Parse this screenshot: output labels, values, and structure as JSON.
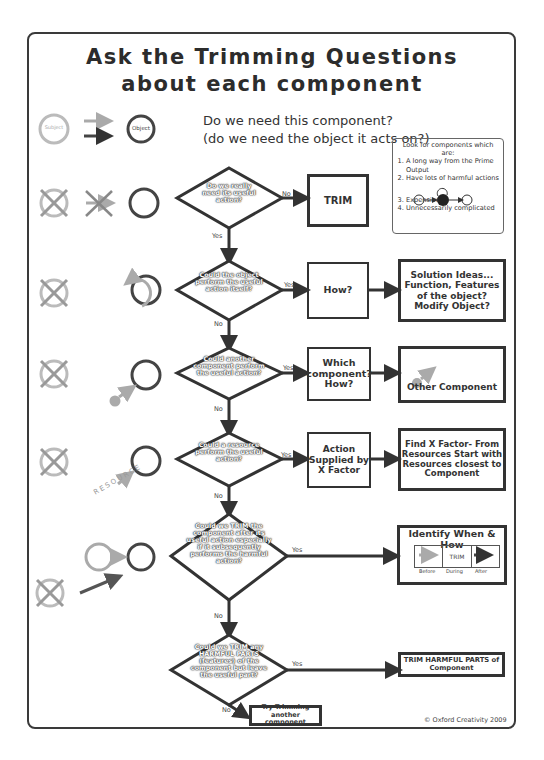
{
  "title": {
    "line1": "Ask the Trimming Questions",
    "line2": "about each component"
  },
  "intro": {
    "subject_label": "Subject",
    "object_label": "Object",
    "question_line1": "Do we need this component?",
    "question_line2": "(do we need the object it acts on?)"
  },
  "lookbox": {
    "heading": "Look for components which are:",
    "items": [
      "A long way from the Prime Output",
      "Have lots of harmful actions",
      "Expensive",
      "Unnecessarily complicated"
    ]
  },
  "flow": {
    "q1": {
      "text": "Do we really need its useful action?",
      "no_label": "No",
      "yes_label": "Yes",
      "outcome": "TRIM"
    },
    "q2": {
      "text": "Could the object perform the useful action itself?",
      "yes_label": "Yes",
      "no_label": "No",
      "box1": "How?",
      "box2": "Solution Ideas... Function, Features of the object? Modify Object?"
    },
    "q3": {
      "text": "Could another component perform the useful action?",
      "yes_label": "Yes",
      "no_label": "No",
      "box1": "Which component? How?",
      "box2": "Other Component"
    },
    "q4": {
      "text": "Could a resource perform the useful action?",
      "yes_label": "Yes",
      "no_label": "No",
      "box1": "Action Supplied by X Factor",
      "box2": "Find X Factor- From Resources Start with Resources closest to Component"
    },
    "q5": {
      "text": "Could we TRIM the component after its useful action especially if it subsequently performs the harmful action?",
      "yes_label": "Yes",
      "no_label": "No",
      "box_title": "Identify When & How",
      "timeline": {
        "before": "Before",
        "during": "During",
        "after": "After",
        "trim": "TRIM"
      }
    },
    "q6": {
      "text": "Could we TRIM any HARMFUL PARTS (features) of the component but leave the useful part?",
      "yes_label": "Yes",
      "no_label": "No",
      "outcome": "TRIM HARMFUL PARTS of Component",
      "fallback": "Try Trimming another component"
    }
  },
  "resource_label": "RESOURCE",
  "copyright": "© Oxford Creativity 2009",
  "colors": {
    "dark": "#3a3a3a",
    "grey": "#a8a8a8",
    "mid": "#6a6a6a"
  }
}
